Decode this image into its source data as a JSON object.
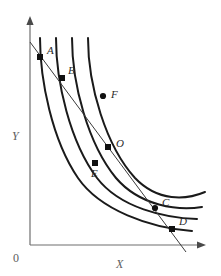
{
  "figure": {
    "background_color": "#ffffff",
    "width": 221,
    "height": 276
  },
  "axes": {
    "x_label": "X",
    "y_label": "Y",
    "origin_label": "0",
    "axis_color": "#6f6f6f",
    "origin_px": {
      "x": 30,
      "y": 245
    },
    "x_axis_end_px": {
      "x": 205,
      "y": 245
    },
    "y_axis_end_px": {
      "x": 30,
      "y": 18
    }
  },
  "chart_data": {
    "type": "line",
    "title": "",
    "subtitle": "",
    "xlabel": "X",
    "ylabel": "Y",
    "grid": false,
    "legend_position": "none",
    "xlim": [
      0,
      221
    ],
    "ylim": [
      0,
      276
    ],
    "curve_color": "#1a1a1a",
    "budget_line_color": "#3a3a3a",
    "series": [
      {
        "name": "indifference-curve-1",
        "order": 1,
        "path": "M 40,38 C 40,80 52,140 78,178 C 100,210 150,228 192,231",
        "points_on_curve": [
          "A",
          "E"
        ]
      },
      {
        "name": "indifference-curve-2",
        "order": 2,
        "path": "M 56,38 C 56,82 70,142 97,178 C 120,208 165,218 197,219",
        "points_on_curve": [
          "B",
          "C"
        ]
      },
      {
        "name": "indifference-curve-3",
        "order": 3,
        "path": "M 72,38 C 72,84 88,144 116,178 C 140,206 178,211 202,207",
        "points_on_curve": [
          "O",
          "D"
        ]
      },
      {
        "name": "indifference-curve-4",
        "order": 4,
        "path": "M 88,38 C 88,86 106,146 135,178 C 158,202 186,200 205,192",
        "points_on_curve": [
          "F"
        ]
      }
    ],
    "budget_line": {
      "name": "budget-line",
      "x1": 30,
      "y1": 42,
      "x2": 186,
      "y2": 252,
      "slope_description": "negative, straight"
    },
    "points": [
      {
        "label": "A",
        "x": 40,
        "y": 57,
        "marker": "square",
        "label_dx": 7,
        "label_dy": -3
      },
      {
        "label": "B",
        "x": 62,
        "y": 78,
        "marker": "square",
        "label_dx": 6,
        "label_dy": -4
      },
      {
        "label": "F",
        "x": 103,
        "y": 96,
        "marker": "circle",
        "label_dx": 8,
        "label_dy": 2
      },
      {
        "label": "O",
        "x": 108,
        "y": 147,
        "marker": "square",
        "label_dx": 8,
        "label_dy": 0
      },
      {
        "label": "E",
        "x": 95,
        "y": 163,
        "marker": "square",
        "label_dx": -4,
        "label_dy": 14
      },
      {
        "label": "C",
        "x": 155,
        "y": 208,
        "marker": "circle",
        "label_dx": 7,
        "label_dy": -2
      },
      {
        "label": "D",
        "x": 172,
        "y": 229,
        "marker": "square",
        "label_dx": 7,
        "label_dy": -4
      }
    ]
  }
}
